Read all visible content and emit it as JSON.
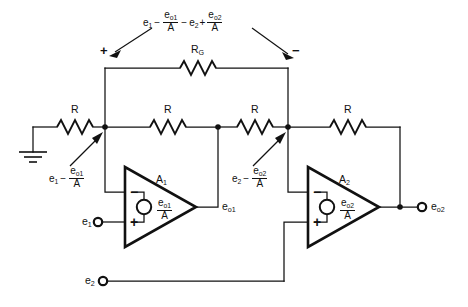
{
  "diagram": {
    "background_color": "#ffffff",
    "line_color": "#111111"
  },
  "top_annotation": {
    "name": "differential-voltage-across-rg",
    "parts": {
      "e1": "e",
      "e1_sub": "1",
      "minus1": "−",
      "eo1_num": "e",
      "eo1_sub": "o1",
      "eo1_den": "A",
      "minus2": "−",
      "e2": "e",
      "e2_sub": "2",
      "plus1": "+",
      "eo2_num": "e",
      "eo2_sub": "o2",
      "eo2_den": "A"
    },
    "plain_text": "e1 - eo1/A - e2 + eo2/A"
  },
  "polarity": {
    "left": "+",
    "right": "−"
  },
  "resistors": {
    "gain": {
      "label_main": "R",
      "label_sub": "G",
      "name": "resistor-rg"
    },
    "r1": {
      "label": "R",
      "name": "resistor-r1"
    },
    "r2": {
      "label": "R",
      "name": "resistor-r2"
    },
    "r3": {
      "label": "R",
      "name": "resistor-r3"
    },
    "r4": {
      "label": "R",
      "name": "resistor-r4"
    }
  },
  "opamps": [
    {
      "name": "opamp-a1",
      "designator_main": "A",
      "designator_sub": "1",
      "inverting_sign": "−",
      "noninverting_sign": "+",
      "internal_source": {
        "num_main": "e",
        "num_sub": "o1",
        "den": "A",
        "plain_text": "eo1/A"
      },
      "output_label_main": "e",
      "output_label_sub": "o1"
    },
    {
      "name": "opamp-a2",
      "designator_main": "A",
      "designator_sub": "2",
      "inverting_sign": "−",
      "noninverting_sign": "+",
      "internal_source": {
        "num_main": "e",
        "num_sub": "o2",
        "den": "A",
        "plain_text": "eo2/A"
      },
      "output_label_main": "e",
      "output_label_sub": "o2"
    }
  ],
  "node_annotations": [
    {
      "name": "node-annotation-left",
      "main": "e",
      "main_sub": "1",
      "op": "−",
      "num_main": "e",
      "num_sub": "o1",
      "den": "A",
      "plain_text": "e1 - eo1/A"
    },
    {
      "name": "node-annotation-right",
      "main": "e",
      "main_sub": "2",
      "op": "−",
      "num_main": "e",
      "num_sub": "o2",
      "den": "A",
      "plain_text": "e2 - eo2/A"
    }
  ],
  "terminals": [
    {
      "name": "terminal-e1",
      "label_main": "e",
      "label_sub": "1",
      "kind": "input"
    },
    {
      "name": "terminal-e2",
      "label_main": "e",
      "label_sub": "2",
      "kind": "input"
    },
    {
      "name": "terminal-eo2",
      "label_main": "e",
      "label_sub": "o2",
      "kind": "output"
    }
  ],
  "ground": {
    "name": "ground-symbol",
    "label": ""
  }
}
